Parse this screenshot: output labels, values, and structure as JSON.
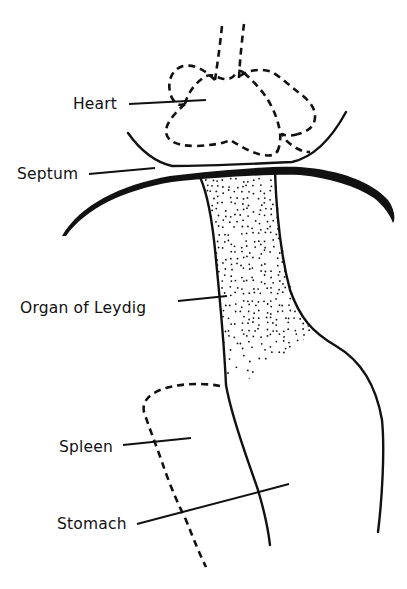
{
  "figure": {
    "type": "anatomical line drawing",
    "style": "black ink on white",
    "colors": {
      "ink": "#111111",
      "background": "#ffffff"
    }
  },
  "labels": {
    "heart": "Heart",
    "septum": "Septum",
    "organ_of_leydig": "Organ of Leydig",
    "spleen": "Spleen",
    "stomach": "Stomach"
  },
  "structures": [
    {
      "id": "heart",
      "label": "Heart",
      "rendering": "dashed outline"
    },
    {
      "id": "septum",
      "label": "Septum",
      "rendering": "thick solid arc"
    },
    {
      "id": "organ-of-leydig",
      "label": "Organ of Leydig",
      "rendering": "stippled region"
    },
    {
      "id": "spleen",
      "label": "Spleen",
      "rendering": "dashed outline"
    },
    {
      "id": "stomach",
      "label": "Stomach",
      "rendering": "solid outline"
    }
  ]
}
